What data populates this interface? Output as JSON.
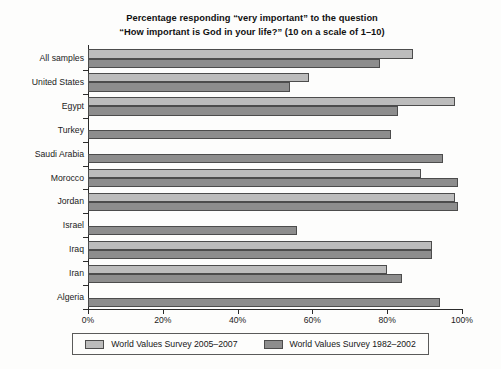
{
  "chart_data": {
    "type": "bar",
    "orientation": "horizontal",
    "title_lines": [
      "Percentage responding “very important” to the question",
      "“How important is God in your life?” (10 on a scale of 1–10)"
    ],
    "title": "Percentage responding “very important” to the question “How important is God in your life?” (10 on a scale of 1–10)",
    "xlabel": "",
    "ylabel": "",
    "xlim": [
      0,
      100
    ],
    "xticks": [
      0,
      20,
      40,
      60,
      80,
      100
    ],
    "xtick_labels": [
      "0%",
      "20%",
      "40%",
      "60%",
      "80%",
      "100%"
    ],
    "grid": false,
    "legend_position": "bottom",
    "categories": [
      "All samples",
      "United States",
      "Egypt",
      "Turkey",
      "Saudi Arabia",
      "Morocco",
      "Jordan",
      "Israel",
      "Iraq",
      "Iran",
      "Algeria"
    ],
    "series": [
      {
        "name": "World Values Survey 2005–2007",
        "color": "#bcbcbc",
        "values": [
          87,
          59,
          98,
          null,
          null,
          89,
          98,
          null,
          92,
          80,
          null
        ]
      },
      {
        "name": "World Values Survey 1982–2002",
        "color": "#8d8d8d",
        "values": [
          78,
          54,
          83,
          81,
          95,
          99,
          99,
          56,
          92,
          84,
          94
        ]
      }
    ]
  },
  "legend": {
    "entries": [
      {
        "label": "World Values Survey 2005–2007",
        "swatch": "light"
      },
      {
        "label": "World Values Survey 1982–2002",
        "swatch": "dark"
      }
    ]
  }
}
